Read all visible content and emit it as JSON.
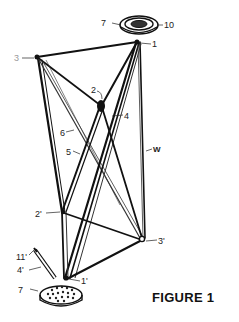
{
  "figure": {
    "caption": "FIGURE 1",
    "labels": {
      "top_disc": "7",
      "top_disc_inner": "10",
      "node_1": "1",
      "node_3": "3",
      "node_2": "2",
      "strut_4": "4",
      "strut_6": "6",
      "strut_5": "5",
      "wire_w": "W",
      "node_2p": "2'",
      "node_3p": "3'",
      "valve_11p": "11'",
      "tube_4p": "4'",
      "bottom_disc": "7",
      "node_1p": "1'"
    }
  }
}
